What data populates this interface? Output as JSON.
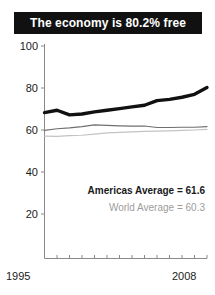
{
  "header": {
    "title": "The economy is 80.2% free",
    "background": "#111111",
    "text_color": "#ffffff"
  },
  "annotations": {
    "americas": "Americas Average = 61.6",
    "world": "World Average = 60.3",
    "americas_color": "#1a1a1a",
    "world_color": "#9d9d9d"
  },
  "chart_data": {
    "type": "line",
    "title": "The economy is 80.2% free",
    "xlabel": "",
    "ylabel": "",
    "xlim": [
      1995,
      2008
    ],
    "ylim": [
      0,
      100
    ],
    "yticks": [
      20,
      40,
      60,
      80,
      100
    ],
    "xticks": [
      1995,
      2008
    ],
    "xtick_labels": [
      "1995",
      "2008"
    ],
    "ytick_labels": [
      "20",
      "40",
      "60",
      "80",
      "100"
    ],
    "grid": false,
    "legend_position": "inline-annotation",
    "x": [
      1995,
      1996,
      1997,
      1998,
      1999,
      2000,
      2001,
      2002,
      2003,
      2004,
      2005,
      2006,
      2007,
      2008
    ],
    "series": [
      {
        "name": "Country score",
        "color": "#111111",
        "width": 3.4,
        "values": [
          68.3,
          69.4,
          67.2,
          67.6,
          68.6,
          69.4,
          70.2,
          71.0,
          71.8,
          74.0,
          74.6,
          75.6,
          77.0,
          80.2
        ]
      },
      {
        "name": "Americas Average",
        "color": "#6f6f6f",
        "width": 1.2,
        "values": [
          59.8,
          60.6,
          61.0,
          61.6,
          62.4,
          62.2,
          62.0,
          61.8,
          61.9,
          61.2,
          61.2,
          61.3,
          61.3,
          61.6
        ]
      },
      {
        "name": "World Average",
        "color": "#c3c3c3",
        "width": 1.2,
        "values": [
          57.1,
          57.0,
          57.3,
          57.5,
          58.0,
          58.6,
          58.9,
          59.1,
          59.3,
          59.5,
          59.6,
          59.8,
          60.0,
          60.3
        ]
      }
    ],
    "americas_average": 61.6,
    "world_average": 60.3,
    "country_final": 80.2
  }
}
